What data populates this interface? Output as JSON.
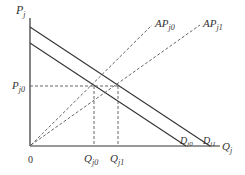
{
  "diagram": {
    "type": "economics-supply-demand",
    "axes": {
      "y_label": {
        "main": "P",
        "sub": "j"
      },
      "x_label": {
        "main": "Q",
        "sub": "j"
      },
      "origin_label": "0"
    },
    "price_level": {
      "main": "P",
      "sub": "j0"
    },
    "quantities": [
      {
        "main": "Q",
        "sub": "j0"
      },
      {
        "main": "Q",
        "sub": "j1"
      }
    ],
    "demand_curves": [
      {
        "main": "D",
        "sub": "j0"
      },
      {
        "main": "D",
        "sub": "j1"
      }
    ],
    "ap_curves": [
      {
        "main": "AP",
        "sub": "j0"
      },
      {
        "main": "AP",
        "sub": "j1"
      }
    ],
    "colors": {
      "line": "#333333",
      "dash": "#555555",
      "text": "#333333"
    }
  }
}
